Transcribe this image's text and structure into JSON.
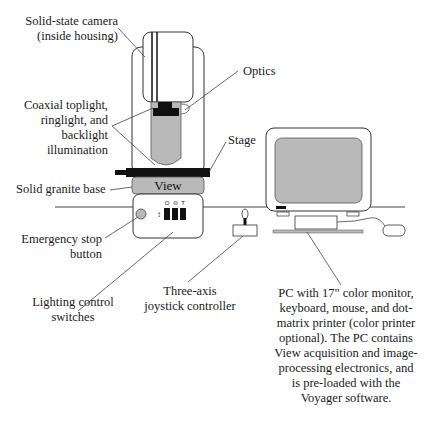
{
  "diagram": {
    "colors": {
      "line": "#333333",
      "gray_fill": "#b9b9b9",
      "black_fill": "#111111",
      "background": "#ffffff"
    },
    "base_label": "View",
    "switch_symbols": [
      "O",
      "⊜",
      "T"
    ],
    "labels": {
      "camera": [
        "Solid-state camera",
        "(inside housing)"
      ],
      "optics": [
        "Optics"
      ],
      "illumination": [
        "Coaxial toplight,",
        "ringlight, and",
        "backlight",
        "illumination"
      ],
      "stage": [
        "Stage"
      ],
      "granite": [
        "Solid granite base"
      ],
      "estop": [
        "Emergency stop",
        "button"
      ],
      "lighting": [
        "Lighting control",
        "switches"
      ],
      "joystick": [
        "Three-axis",
        "joystick controller"
      ],
      "pc": [
        "PC with 17\" color monitor,",
        "keyboard, mouse, and dot-",
        "matrix printer (color printer",
        "optional). The PC contains",
        "View acquisition and image-",
        "processing electronics, and",
        "is pre-loaded with the",
        "Voyager software."
      ]
    }
  }
}
